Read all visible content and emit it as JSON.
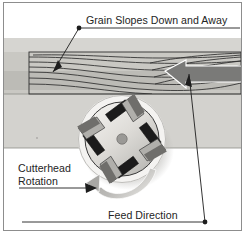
{
  "figure": {
    "type": "technical-illustration"
  },
  "labels": {
    "grain": "Grain Slopes Down and Away",
    "cutterhead_line1": "Cutterhead",
    "cutterhead_line2": "Rotation",
    "feed": "Feed Direction"
  },
  "icons": {
    "grain_leader": "leader-line-with-dot-icon",
    "feed_leader": "leader-line-with-dot-icon",
    "feed_arrow": "large-left-arrow-icon",
    "rotation_arrow": "curved-rotation-arrow-icon",
    "cutterhead_pointer": "right-arrow-icon",
    "grain_pointer": "down-left-arrow-icon"
  },
  "colors": {
    "background": "#ffffff",
    "border": "#8d8d8d",
    "band_light": "#d6d5d1",
    "band_mid": "#c6c5c1",
    "band_dark": "#a3a29e",
    "board_face": "#c9c8c3",
    "grain_line": "#2b2b2b",
    "feed_arrow": "#7a7a78",
    "cutterhead_body": "#d9d8d4",
    "cutterhead_outline": "#3a3a3a",
    "blade_dark": "#1b1b1b",
    "blade_gib": "#b8b7b3",
    "hub": "#9a9996",
    "text": "#242424",
    "rotation_arrow": "#9d9c99"
  },
  "geometry": {
    "canvas_width": 245,
    "canvas_height": 234,
    "cutterhead_center_x": 122,
    "cutterhead_center_y": 139,
    "cutterhead_radius": 42,
    "blade_count": 4
  }
}
